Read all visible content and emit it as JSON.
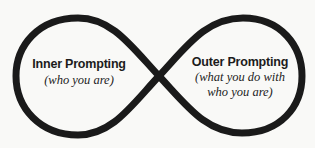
{
  "diagram": {
    "type": "infinity-loop",
    "stroke_color": "#1a1a1a",
    "background_color": "#f9f9f7",
    "left_loop": {
      "title": "Inner Prompting",
      "subtitle_lines": [
        "(who you are)"
      ]
    },
    "right_loop": {
      "title": "Outer Prompting",
      "subtitle_lines": [
        "(what you do with",
        "who you are)"
      ]
    }
  }
}
